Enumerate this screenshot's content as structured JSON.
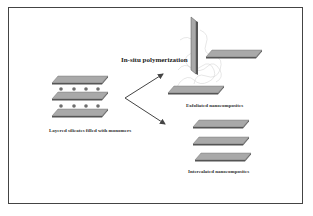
{
  "diagram": {
    "process_label": "In-situ polymerization",
    "start": {
      "label": "Layered silicates filled with monomers",
      "layers": 3,
      "monomers_per_gap": 4
    },
    "outcomes": [
      {
        "label": "Exfoliated nanocomposites"
      },
      {
        "label": "Intercalated nanocomposites",
        "layers": 3
      }
    ],
    "colors": {
      "plate_fill": "#a9a9a9",
      "plate_edge": "#555555",
      "monomer": "#6e6e6e",
      "arrow": "#444444",
      "frame": "#444444",
      "polymer": "#cfcfcf"
    }
  }
}
